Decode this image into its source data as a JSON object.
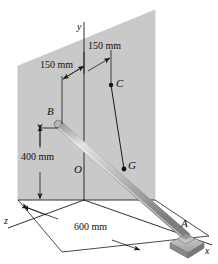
{
  "figure": {
    "colors": {
      "wall": "#c9c9c9",
      "wall_edge": "#8f8f8f",
      "rod_light": "#d8d8d8",
      "rod_mid": "#b0b0b0",
      "rod_dark": "#8a8a8a",
      "line": "#1a1a1a",
      "pedestal": "#b8b8b8",
      "background": "#ffffff"
    },
    "points": [
      {
        "name": "point-b",
        "label": "B"
      },
      {
        "name": "point-c",
        "label": "C"
      },
      {
        "name": "point-g",
        "label": "G"
      },
      {
        "name": "point-a",
        "label": "A"
      },
      {
        "name": "origin-o",
        "label": "O"
      }
    ],
    "axes": [
      {
        "name": "axis-y",
        "label": "y"
      },
      {
        "name": "axis-x",
        "label": "x"
      },
      {
        "name": "axis-z",
        "label": "z"
      }
    ],
    "dimensions": [
      {
        "name": "dim-150-upper",
        "label": "150 mm"
      },
      {
        "name": "dim-150-lower",
        "label": "150 mm"
      },
      {
        "name": "dim-400",
        "label": "400 mm"
      },
      {
        "name": "dim-600",
        "label": "600 mm"
      }
    ]
  }
}
